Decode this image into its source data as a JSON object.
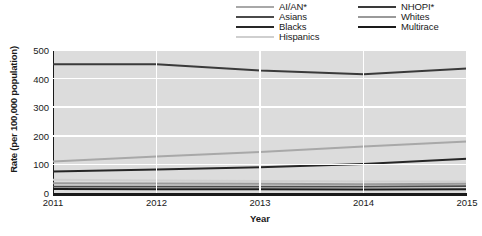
{
  "chart_data": {
    "type": "line",
    "title": "",
    "xlabel": "Year",
    "ylabel": "Rate (per 100,000 population)",
    "x": [
      2011,
      2012,
      2013,
      2014,
      2015
    ],
    "xtick_labels": [
      "2011",
      "2012",
      "2013",
      "2014",
      "2015"
    ],
    "ytick_labels": [
      "0",
      "100",
      "200",
      "300",
      "400",
      "500"
    ],
    "yticks": [
      0,
      100,
      200,
      300,
      400,
      500
    ],
    "ylim": [
      0,
      500
    ],
    "xlim": [
      2011,
      2015
    ],
    "grid": "white gridlines on gray panel",
    "legend_position": "top-right, two columns",
    "series": [
      {
        "name": "AI/AN*",
        "color": "#a8a8a8",
        "width": 2.0,
        "values": [
          110,
          128,
          143,
          163,
          180
        ]
      },
      {
        "name": "Asians",
        "color": "#4a4a4a",
        "width": 1.8,
        "values": [
          22,
          22,
          22,
          22,
          24
        ]
      },
      {
        "name": "Blacks",
        "color": "#262626",
        "width": 2.0,
        "values": [
          75,
          82,
          90,
          101,
          120
        ]
      },
      {
        "name": "Hispanics",
        "color": "#cfcfcf",
        "width": 2.0,
        "values": [
          46,
          44,
          42,
          40,
          40
        ]
      },
      {
        "name": "NHOPI*",
        "color": "#3a3a3a",
        "width": 2.0,
        "values": [
          450,
          450,
          428,
          415,
          435
        ]
      },
      {
        "name": "Whites",
        "color": "#9a9a9a",
        "width": 2.0,
        "values": [
          34,
          33,
          32,
          31,
          32
        ]
      },
      {
        "name": "Multirace",
        "color": "#1a1a1a",
        "width": 2.0,
        "values": [
          14,
          13,
          13,
          12,
          13
        ]
      }
    ]
  },
  "legend": {
    "columns": [
      {
        "items": [
          {
            "label": "AI/AN*",
            "color": "#a8a8a8"
          },
          {
            "label": "Asians",
            "color": "#4a4a4a"
          },
          {
            "label": "Blacks",
            "color": "#262626"
          },
          {
            "label": "Hispanics",
            "color": "#cfcfcf"
          }
        ]
      },
      {
        "items": [
          {
            "label": "NHOPI*",
            "color": "#3a3a3a"
          },
          {
            "label": "Whites",
            "color": "#9a9a9a"
          },
          {
            "label": "Multirace",
            "color": "#1a1a1a"
          }
        ]
      }
    ]
  },
  "axes": {
    "y_title": "Rate (per 100,000 population)",
    "x_title": "Year"
  }
}
